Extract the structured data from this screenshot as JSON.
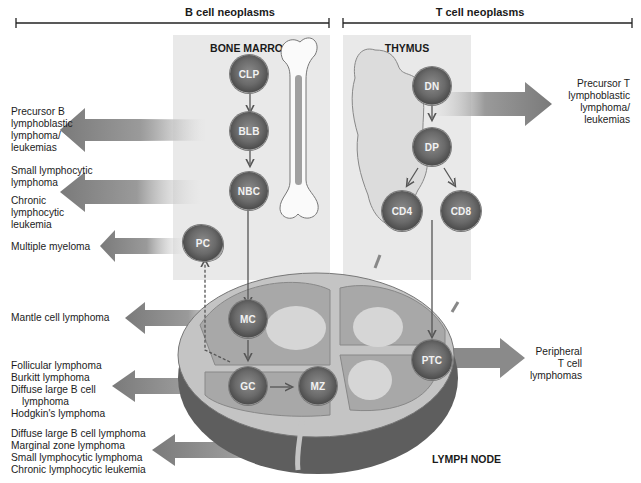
{
  "headers": {
    "b_cell": "B cell neoplasms",
    "t_cell": "T cell neoplasms"
  },
  "panels": {
    "bone_marrow": "BONE MARROW",
    "thymus": "THYMUS",
    "lymph_node": "LYMPH NODE"
  },
  "cells": {
    "clp": "CLP",
    "blb": "BLB",
    "nbc": "NBC",
    "pc": "PC",
    "mc": "MC",
    "gc": "GC",
    "mz": "MZ",
    "dn": "DN",
    "dp": "DP",
    "cd4": "CD4",
    "cd8": "CD8",
    "ptc": "PTC"
  },
  "neoplasms": {
    "precursor_b": [
      "Precursor B",
      "lymphoblastic",
      "lymphoma/",
      "leukemias"
    ],
    "small_lymphocytic": [
      "Small lymphocytic",
      "lymphoma"
    ],
    "chronic_lymphocytic": [
      "Chronic",
      "lymphocytic",
      "leukemia"
    ],
    "multiple_myeloma": [
      "Multiple myeloma"
    ],
    "mantle_cell": [
      "Mantle cell lymphoma"
    ],
    "germinal_center": [
      "Follicular lymphoma",
      "Burkitt lymphoma",
      "Diffuse large B cell",
      "lymphoma",
      "Hodgkin's lymphoma"
    ],
    "marginal_zone": [
      "Diffuse large B cell lymphoma",
      "Marginal zone lymphoma",
      "Small lymphocytic lymphoma",
      "Chronic lymphocytic leukemia"
    ],
    "precursor_t": [
      "Precursor T",
      "lymphoblastic",
      "lymphoma/",
      "leukemias"
    ],
    "peripheral_t": [
      "Peripheral",
      "T cell",
      "lymphomas"
    ]
  },
  "colors": {
    "panel_bg": "#e9e9e9",
    "arrow_dark": "#7d7d7d",
    "cell_dark": "#5a5a5a",
    "node_dark": "#6e6e6e",
    "node_mid": "#a9a9a9",
    "node_light": "#cfcfcf"
  }
}
